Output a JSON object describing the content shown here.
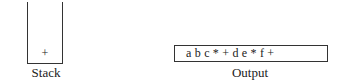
{
  "stack": {
    "label": "Stack",
    "items": [
      "+"
    ]
  },
  "output": {
    "label": "Output",
    "value": "a b c * + d e * f +"
  },
  "colors": {
    "line": "#333333",
    "text": "#222222",
    "background": "#ffffff"
  }
}
